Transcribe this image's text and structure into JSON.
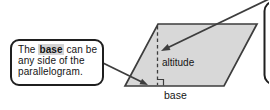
{
  "diagram": {
    "callout": {
      "line1_pre": "The ",
      "line1_bold": "base",
      "line1_post": " can be",
      "line2": "any side of the",
      "line3": "parallelogram."
    },
    "labels": {
      "altitude": "altitude",
      "base": "base"
    },
    "colors": {
      "background": "#ffffff",
      "shape_fill": "#d8d8d8",
      "line": "#3d3d3d",
      "callout_border": "#1f1f1f",
      "highlight": "#d4d4d4",
      "text": "#151515"
    }
  }
}
